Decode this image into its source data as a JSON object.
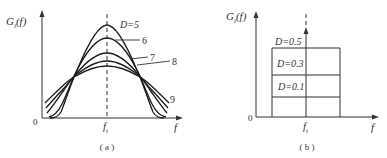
{
  "panel_a": {
    "ylabel": "G",
    "ylabel_sub": "i",
    "ylabel_arg": "(f)",
    "origin": "0",
    "xlabel": "f",
    "center_label": "f",
    "center_sub": "i",
    "caption": "( a )",
    "curve_labels": [
      {
        "text": "D=5"
      },
      {
        "text": "6"
      },
      {
        "text": "7"
      },
      {
        "text": "8"
      },
      {
        "text": "9"
      }
    ]
  },
  "panel_b": {
    "ylabel": "G",
    "ylabel_sub": "i",
    "ylabel_arg": "(f)",
    "origin": "0",
    "xlabel": "f",
    "center_label": "f",
    "center_sub": "i",
    "caption": "( b )",
    "level_labels": [
      {
        "text": "D=0.5"
      },
      {
        "text": "D=0.3"
      },
      {
        "text": "D=0.1"
      }
    ]
  },
  "colors": {
    "ink": "#1a1a1a",
    "text": "#333333",
    "background": "#ffffff"
  }
}
